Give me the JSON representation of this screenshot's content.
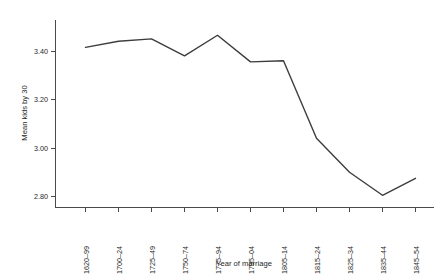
{
  "chart_data": {
    "type": "line",
    "title": "",
    "subtitle": "",
    "xlabel": "Year of marriage",
    "ylabel": "Mean kids by 30",
    "categories": [
      "1620–99",
      "1700–24",
      "1725–49",
      "1750–74",
      "1775–94",
      "1795–04",
      "1805–14",
      "1815–24",
      "1825–34",
      "1835–44",
      "1845–54"
    ],
    "values": [
      3.415,
      3.44,
      3.45,
      3.38,
      3.465,
      3.355,
      3.36,
      3.04,
      2.9,
      2.805,
      2.875
    ],
    "series": [
      {
        "name": "Mean kids by 30",
        "values": [
          3.415,
          3.44,
          3.45,
          3.38,
          3.465,
          3.355,
          3.36,
          3.04,
          2.9,
          2.805,
          2.875
        ]
      }
    ],
    "yticks": [
      "2.80",
      "3.00",
      "3.20",
      "3.40"
    ],
    "ytick_values": [
      2.8,
      3.0,
      3.2,
      3.4
    ],
    "ylim": [
      2.74,
      3.52
    ],
    "xlim": [
      -0.5,
      10.5
    ],
    "grid": false,
    "legend": false,
    "legend_position": "none",
    "line_color": "#3d3d3d",
    "axis_color": "#4a4a4a",
    "background_color": "#ffffff"
  },
  "axes": {
    "x_title": "Year of marriage",
    "y_title": "Mean kids by 30"
  }
}
